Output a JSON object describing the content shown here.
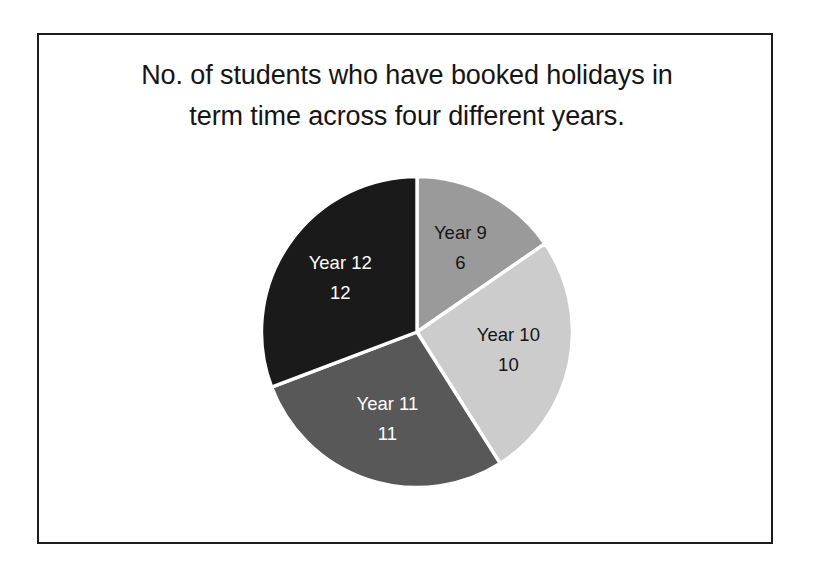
{
  "chart_data": {
    "type": "pie",
    "title": "No. of students who have booked holidays in term time across four different years.",
    "title_lines": [
      "No. of students who have booked holidays in",
      "term time across four different years."
    ],
    "categories": [
      "Year 9",
      "Year 10",
      "Year 11",
      "Year 12"
    ],
    "values": [
      6,
      10,
      11,
      12
    ],
    "total": 39,
    "xlabel": "",
    "ylabel": "",
    "grid": false,
    "legend": "none",
    "labels_inside_slices": true,
    "start_angle_deg": 0,
    "direction": "clockwise",
    "slices": [
      {
        "label": "Year 9",
        "value": 6,
        "value_text": "6",
        "color": "#9a9a9a",
        "text_color": "#151515",
        "share_pct": 15.4,
        "angle_deg": 55.4
      },
      {
        "label": "Year 10",
        "value": 10,
        "value_text": "10",
        "color": "#cccccc",
        "text_color": "#151515",
        "share_pct": 25.6,
        "angle_deg": 92.3
      },
      {
        "label": "Year 11",
        "value": 11,
        "value_text": "11",
        "color": "#585858",
        "text_color": "#ffffff",
        "share_pct": 28.2,
        "angle_deg": 101.5
      },
      {
        "label": "Year 12",
        "value": 12,
        "value_text": "12",
        "color": "#1a1a1a",
        "text_color": "#ffffff",
        "share_pct": 30.8,
        "angle_deg": 110.8
      }
    ],
    "separator_color": "#ffffff",
    "frame_color": "#1c1c1c",
    "background_color": "#ffffff"
  }
}
